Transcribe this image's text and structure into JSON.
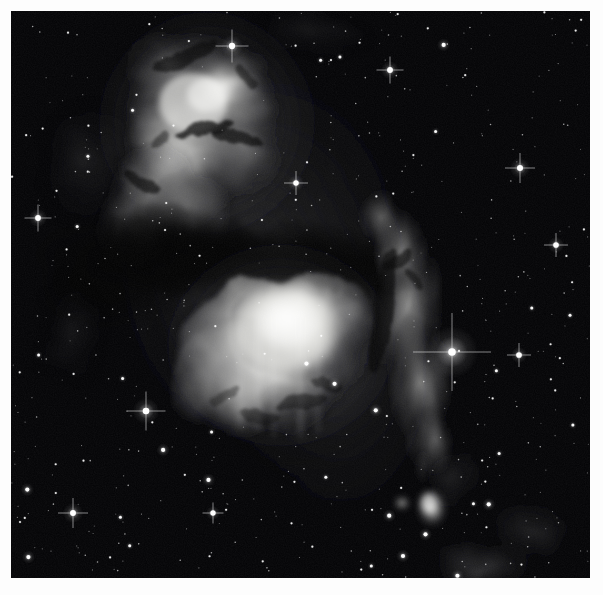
{
  "image": {
    "kind": "astronomical-photograph",
    "subject_label": "reflection nebula complex",
    "color_mode": "grayscale",
    "frame": {
      "outer_width_px": 603,
      "outer_height_px": 595,
      "border_color": "#ffffff",
      "border_left_px": 11,
      "border_top_px": 11,
      "plate_width_px": 579,
      "plate_height_px": 567,
      "sky_background_color": "#020204"
    },
    "palette": {
      "sky": "#020204",
      "faint_nebula": "#2a2a2c",
      "mid_nebula": "#7a7a7c",
      "bright_nebula": "#d8d8d6",
      "core_white": "#f2f2f0",
      "dust_lane": "#060608",
      "star_white": "#ffffff"
    },
    "features": [
      {
        "name": "upper-reflection-nebula",
        "description": "bright filamentary reflection nebula in upper left-of-center, wedge shaped, with dark dust intrusions",
        "cx_px": 196,
        "cy_px": 110,
        "rx_px": 92,
        "ry_px": 96,
        "peak_brightness": 0.93
      },
      {
        "name": "lower-main-nebula",
        "description": "large oval bright glowing nebula below centre, brightest core offset to upper-centre",
        "cx_px": 275,
        "cy_px": 350,
        "rx_px": 96,
        "ry_px": 80,
        "peak_brightness": 1.0
      },
      {
        "name": "eastern-nebula-arm",
        "description": "vertical streaming nebulous arm running down the right of the dark lane toward a bright star",
        "cx_px": 410,
        "cy_px": 330,
        "rx_px": 48,
        "ry_px": 110,
        "peak_brightness": 0.55
      },
      {
        "name": "dark-dust-lane",
        "description": "broad dark absorption lane separating the upper and lower nebulae, arcing from left edge to the right arm",
        "cx_px": 250,
        "cy_px": 258,
        "rx_px": 150,
        "ry_px": 38,
        "peak_brightness": 0.02
      },
      {
        "name": "southern-nebulous-knot",
        "description": "small detached bright knot low in the frame with a faint companion blob",
        "cx_px": 420,
        "cy_px": 497,
        "rx_px": 17,
        "ry_px": 20,
        "peak_brightness": 0.78
      },
      {
        "name": "faint-southern-streamer",
        "description": "faint diffuse nebulosity trailing toward the lower right corner",
        "cx_px": 470,
        "cy_px": 555,
        "rx_px": 60,
        "ry_px": 28,
        "peak_brightness": 0.22
      }
    ],
    "notable_stars": [
      {
        "name": "bright-star-east",
        "x_px": 452,
        "y_px": 352,
        "magnitude_rel": 1.0,
        "halo_px": 26
      },
      {
        "name": "bright-star-southwest",
        "x_px": 146,
        "y_px": 411,
        "magnitude_rel": 0.78,
        "halo_px": 13
      },
      {
        "name": "bright-star-lower-left",
        "x_px": 73,
        "y_px": 513,
        "magnitude_rel": 0.62,
        "halo_px": 10
      },
      {
        "name": "bright-star-west",
        "x_px": 38,
        "y_px": 218,
        "magnitude_rel": 0.58,
        "halo_px": 9
      },
      {
        "name": "bright-star-in-nebula",
        "x_px": 232,
        "y_px": 46,
        "magnitude_rel": 0.7,
        "halo_px": 11
      },
      {
        "name": "bright-star-north-east",
        "x_px": 390,
        "y_px": 70,
        "magnitude_rel": 0.6,
        "halo_px": 9
      },
      {
        "name": "bright-star-far-east",
        "x_px": 520,
        "y_px": 168,
        "magnitude_rel": 0.66,
        "halo_px": 10
      },
      {
        "name": "bright-star-east-mid",
        "x_px": 556,
        "y_px": 245,
        "magnitude_rel": 0.55,
        "halo_px": 8
      },
      {
        "name": "bright-star-south-east",
        "x_px": 519,
        "y_px": 355,
        "magnitude_rel": 0.57,
        "halo_px": 8
      },
      {
        "name": "bright-star-south",
        "x_px": 296,
        "y_px": 183,
        "magnitude_rel": 0.52,
        "halo_px": 8
      },
      {
        "name": "bright-star-bottom",
        "x_px": 213,
        "y_px": 513,
        "magnitude_rel": 0.5,
        "halo_px": 7
      }
    ],
    "star_count_estimate": 640
  }
}
